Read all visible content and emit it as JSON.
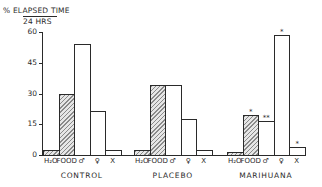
{
  "chart_data": {
    "type": "bar",
    "title": "",
    "ylabel": "% ELAPSED TIME / 24 HRS",
    "ylabel_numerator": "% ELAPSED TIME",
    "ylabel_denominator": "24 HRS",
    "xlabel": "",
    "ylim": [
      0,
      60
    ],
    "yticks": [
      0,
      15,
      30,
      45,
      60
    ],
    "grid": false,
    "legend": null,
    "categories": [
      "H2O",
      "FOOD",
      "♂",
      "♀",
      "X"
    ],
    "category_labels": [
      "H₂O",
      "FOOD",
      "♂",
      "♀",
      "X"
    ],
    "category_fill": [
      "hatched",
      "hatched",
      "open",
      "open",
      "open"
    ],
    "groups": [
      "CONTROL",
      "PLACEBO",
      "MARIHUANA"
    ],
    "series": [
      {
        "name": "CONTROL",
        "values": [
          2.5,
          30,
          54,
          21.5,
          2.5
        ],
        "annotations": [
          "",
          "",
          "",
          "",
          ""
        ]
      },
      {
        "name": "PLACEBO",
        "values": [
          2.5,
          34,
          34,
          17.5,
          2.5
        ],
        "annotations": [
          "",
          "",
          "",
          "",
          ""
        ]
      },
      {
        "name": "MARIHUANA",
        "values": [
          1.5,
          19.5,
          16.5,
          58.5,
          4
        ],
        "annotations": [
          "",
          "*",
          "**",
          "*",
          "*"
        ]
      }
    ]
  }
}
